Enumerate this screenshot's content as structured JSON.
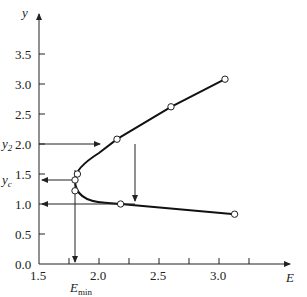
{
  "chart_data": {
    "type": "line",
    "title": "",
    "xlabel": "E",
    "ylabel": "y",
    "xlim": [
      1.5,
      3.25
    ],
    "ylim": [
      0,
      4.0
    ],
    "x_ticks": [
      "1.5",
      "2.0",
      "2.5",
      "3.0"
    ],
    "y_ticks": [
      "0.0",
      "0.5",
      "1.0",
      "1.5",
      "2.0",
      "2.5",
      "3.0",
      "3.5"
    ],
    "series": [
      {
        "name": "upper branch (subcritical)",
        "points": [
          [
            1.82,
            1.5
          ],
          [
            2.15,
            2.08
          ],
          [
            2.6,
            2.62
          ],
          [
            3.05,
            3.08
          ]
        ]
      },
      {
        "name": "lower branch (supercritical)",
        "points": [
          [
            1.8,
            1.22
          ],
          [
            2.18,
            1.0
          ],
          [
            3.13,
            0.83
          ]
        ]
      }
    ],
    "critical_point": [
      1.8,
      1.4
    ],
    "annotations": [
      "y2",
      "yc",
      "Emin"
    ],
    "grid": false
  },
  "labels": {
    "y": "y",
    "E": "E",
    "y2": "y",
    "y2_sub": "2",
    "yc": "y",
    "yc_sub": "c",
    "emin": "E",
    "emin_sub": "min"
  }
}
